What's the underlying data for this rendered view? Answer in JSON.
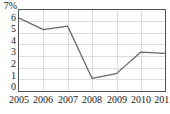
{
  "chart_data": {
    "type": "line",
    "title": "",
    "subtitle": "",
    "xlabel": "",
    "ylabel": "",
    "unit_label": "7%",
    "categories": [
      "2005",
      "2006",
      "2007",
      "2008",
      "2009",
      "2010",
      "2011"
    ],
    "values": [
      6.3,
      5.3,
      5.6,
      1.1,
      1.5,
      3.35,
      3.25
    ],
    "series": [
      {
        "name": "",
        "values": [
          6.3,
          5.3,
          5.6,
          1.1,
          1.5,
          3.35,
          3.25
        ]
      }
    ],
    "ylim": [
      0,
      7
    ],
    "xlim": [
      "2005",
      "2011"
    ],
    "ytick_labels": [
      "7%",
      "6",
      "5",
      "4",
      "3",
      "2",
      "1",
      "0"
    ],
    "ytick_values": [
      7,
      6,
      5,
      4,
      3,
      2,
      1,
      0
    ],
    "xtick_labels": [
      "2005",
      "2006",
      "2007",
      "2008",
      "2009",
      "2010",
      "2011"
    ],
    "grid": true,
    "legend": "none",
    "line_color": "#666666",
    "grid_color": "#dcdcdc",
    "frame_color": "#555555",
    "background_color": "#ffffff"
  }
}
